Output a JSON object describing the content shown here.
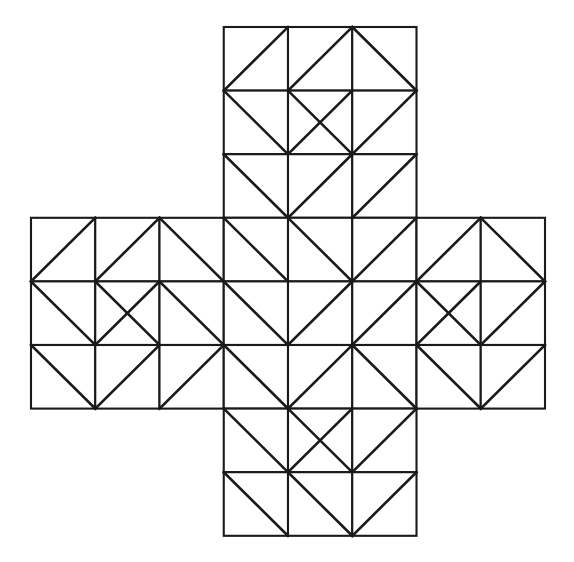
{
  "figure": {
    "name": "plus-shaped-triangle-tessellation",
    "background_color": "#ffffff",
    "line_color": "#1a1a1a",
    "edge_stroke_width": 2.1,
    "diagonal_stroke_width": 2.6
  },
  "chart_data": {
    "type": "diagram",
    "title": "",
    "grid": {
      "columns": 8,
      "rows": 8,
      "origin_x": 31,
      "origin_y": 27,
      "cell_width": 64.25,
      "cell_height": 63.6,
      "shape": "greek-cross",
      "arm_start_col": 3,
      "arm_end_col": 5,
      "arm_start_row": 3,
      "arm_end_row": 5
    },
    "active_cells": [
      [
        3,
        0
      ],
      [
        4,
        0
      ],
      [
        5,
        0
      ],
      [
        3,
        1
      ],
      [
        4,
        1
      ],
      [
        5,
        1
      ],
      [
        3,
        2
      ],
      [
        4,
        2
      ],
      [
        5,
        2
      ],
      [
        0,
        3
      ],
      [
        1,
        3
      ],
      [
        2,
        3
      ],
      [
        3,
        3
      ],
      [
        4,
        3
      ],
      [
        5,
        3
      ],
      [
        6,
        3
      ],
      [
        7,
        3
      ],
      [
        0,
        4
      ],
      [
        1,
        4
      ],
      [
        2,
        4
      ],
      [
        3,
        4
      ],
      [
        4,
        4
      ],
      [
        5,
        4
      ],
      [
        6,
        4
      ],
      [
        7,
        4
      ],
      [
        0,
        5
      ],
      [
        1,
        5
      ],
      [
        2,
        5
      ],
      [
        3,
        5
      ],
      [
        4,
        5
      ],
      [
        5,
        5
      ],
      [
        6,
        5
      ],
      [
        7,
        5
      ],
      [
        3,
        6
      ],
      [
        4,
        6
      ],
      [
        5,
        6
      ],
      [
        3,
        7
      ],
      [
        4,
        7
      ],
      [
        5,
        7
      ]
    ],
    "diagonals": {
      "legend": {
        "slash": "diagonal from bottom-left to top-right",
        "backslash": "diagonal from top-left to bottom-right",
        "cross": "both diagonals present (X)"
      },
      "cells": [
        {
          "col": 3,
          "row": 0,
          "type": "slash"
        },
        {
          "col": 4,
          "row": 0,
          "type": "slash"
        },
        {
          "col": 5,
          "row": 0,
          "type": "backslash"
        },
        {
          "col": 3,
          "row": 1,
          "type": "backslash"
        },
        {
          "col": 4,
          "row": 1,
          "type": "cross"
        },
        {
          "col": 5,
          "row": 1,
          "type": "slash"
        },
        {
          "col": 3,
          "row": 2,
          "type": "backslash"
        },
        {
          "col": 4,
          "row": 2,
          "type": "slash"
        },
        {
          "col": 5,
          "row": 2,
          "type": "slash"
        },
        {
          "col": 0,
          "row": 3,
          "type": "slash"
        },
        {
          "col": 1,
          "row": 3,
          "type": "slash"
        },
        {
          "col": 2,
          "row": 3,
          "type": "backslash"
        },
        {
          "col": 3,
          "row": 3,
          "type": "backslash"
        },
        {
          "col": 4,
          "row": 3,
          "type": "backslash"
        },
        {
          "col": 5,
          "row": 3,
          "type": "slash"
        },
        {
          "col": 6,
          "row": 3,
          "type": "slash"
        },
        {
          "col": 7,
          "row": 3,
          "type": "backslash"
        },
        {
          "col": 0,
          "row": 4,
          "type": "backslash"
        },
        {
          "col": 1,
          "row": 4,
          "type": "cross"
        },
        {
          "col": 2,
          "row": 4,
          "type": "backslash"
        },
        {
          "col": 3,
          "row": 4,
          "type": "backslash"
        },
        {
          "col": 4,
          "row": 4,
          "type": "slash"
        },
        {
          "col": 5,
          "row": 4,
          "type": "slash"
        },
        {
          "col": 6,
          "row": 4,
          "type": "cross"
        },
        {
          "col": 7,
          "row": 4,
          "type": "slash"
        },
        {
          "col": 0,
          "row": 5,
          "type": "backslash"
        },
        {
          "col": 1,
          "row": 5,
          "type": "slash"
        },
        {
          "col": 2,
          "row": 5,
          "type": "slash"
        },
        {
          "col": 3,
          "row": 5,
          "type": "backslash"
        },
        {
          "col": 4,
          "row": 5,
          "type": "slash"
        },
        {
          "col": 5,
          "row": 5,
          "type": "backslash"
        },
        {
          "col": 6,
          "row": 5,
          "type": "backslash"
        },
        {
          "col": 7,
          "row": 5,
          "type": "slash"
        },
        {
          "col": 3,
          "row": 6,
          "type": "backslash"
        },
        {
          "col": 4,
          "row": 6,
          "type": "cross"
        },
        {
          "col": 5,
          "row": 6,
          "type": "slash"
        },
        {
          "col": 3,
          "row": 7,
          "type": "backslash"
        },
        {
          "col": 4,
          "row": 7,
          "type": "backslash"
        },
        {
          "col": 5,
          "row": 7,
          "type": "slash"
        }
      ]
    }
  }
}
